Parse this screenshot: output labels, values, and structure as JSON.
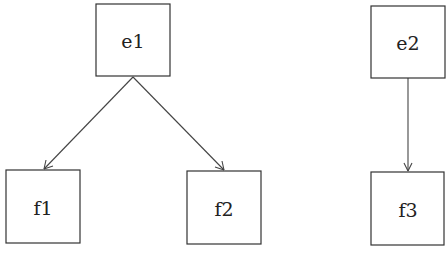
{
  "diagram": {
    "type": "directed-graph",
    "nodes": [
      {
        "id": "e1",
        "label": "e1",
        "x": 96,
        "y": 4,
        "w": 74,
        "h": 72
      },
      {
        "id": "e2",
        "label": "e2",
        "x": 371,
        "y": 6,
        "w": 74,
        "h": 72
      },
      {
        "id": "f1",
        "label": "f1",
        "x": 6,
        "y": 170,
        "w": 74,
        "h": 73
      },
      {
        "id": "f2",
        "label": "f2",
        "x": 187,
        "y": 171,
        "w": 74,
        "h": 73
      },
      {
        "id": "f3",
        "label": "f3",
        "x": 371,
        "y": 172,
        "w": 73,
        "h": 73
      }
    ],
    "edges": [
      {
        "from": "e1",
        "to": "f1"
      },
      {
        "from": "e1",
        "to": "f2"
      },
      {
        "from": "e2",
        "to": "f3"
      }
    ]
  }
}
